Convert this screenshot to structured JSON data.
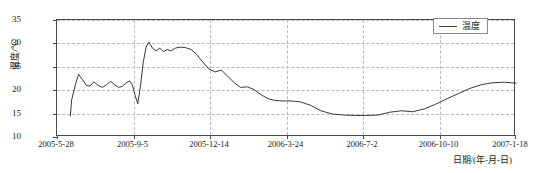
{
  "chart_data": {
    "type": "line",
    "title": "",
    "xlabel": "日期/(年-月-日)",
    "ylabel": "温度/℃",
    "grid": true,
    "legend_position": "top-right",
    "xlim": [
      "2005-5-28",
      "2007-1-18"
    ],
    "ylim": [
      10,
      35
    ],
    "yticks": [
      10,
      15,
      20,
      25,
      30,
      35
    ],
    "xticks": [
      "2005-5-28",
      "2005-9-5",
      "2005-12-14",
      "2006-3-24",
      "2006-7-2",
      "2006-10-10",
      "2007-1-18"
    ],
    "line_color": "#3a3a3a",
    "series": [
      {
        "name": "温度",
        "units": "℃",
        "x": [
          0.029,
          0.032,
          0.041,
          0.047,
          0.056,
          0.064,
          0.072,
          0.08,
          0.09,
          0.099,
          0.108,
          0.117,
          0.126,
          0.134,
          0.142,
          0.15,
          0.158,
          0.164,
          0.17,
          0.176,
          0.182,
          0.188,
          0.194,
          0.2,
          0.208,
          0.216,
          0.224,
          0.232,
          0.24,
          0.248,
          0.258,
          0.268,
          0.28,
          0.292,
          0.304,
          0.316,
          0.33,
          0.344,
          0.358,
          0.372,
          0.386,
          0.4,
          0.415,
          0.43,
          0.445,
          0.46,
          0.475,
          0.492,
          0.51,
          0.53,
          0.552,
          0.575,
          0.6,
          0.625,
          0.65,
          0.675,
          0.7,
          0.725,
          0.75,
          0.775,
          0.8,
          0.825,
          0.85,
          0.875,
          0.9,
          0.925,
          0.95,
          0.975,
          1.0
        ],
        "values": [
          14.5,
          18.0,
          21.5,
          23.4,
          22.2,
          21.0,
          20.9,
          21.8,
          21.0,
          20.6,
          21.2,
          21.9,
          21.1,
          20.6,
          20.8,
          21.5,
          22.0,
          21.2,
          19.0,
          17.1,
          21.0,
          26.0,
          29.2,
          30.3,
          29.0,
          28.4,
          29.0,
          28.2,
          28.7,
          28.4,
          29.0,
          29.2,
          29.1,
          28.7,
          27.7,
          26.2,
          24.6,
          23.9,
          24.3,
          23.0,
          21.6,
          20.6,
          20.7,
          20.1,
          19.0,
          18.2,
          17.8,
          17.7,
          17.7,
          17.5,
          16.8,
          15.6,
          14.9,
          14.7,
          14.6,
          14.6,
          14.7,
          15.3,
          15.6,
          15.4,
          16.0,
          17.0,
          18.2,
          19.3,
          20.4,
          21.2,
          21.6,
          21.7,
          21.5
        ]
      }
    ]
  },
  "legend": {
    "entries": [
      {
        "label": "温度"
      }
    ]
  }
}
